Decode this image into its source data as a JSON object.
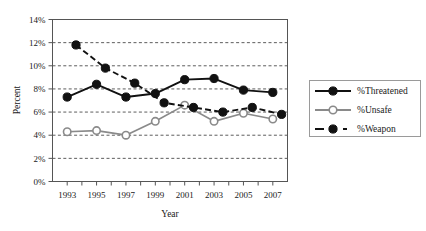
{
  "chart_data": {
    "type": "line",
    "title": "",
    "xlabel": "Year",
    "ylabel": "Percent",
    "x": [
      1993,
      1995,
      1997,
      1999,
      2001,
      2003,
      2005,
      2007
    ],
    "xtick_labels": [
      "1993",
      "1995",
      "1997",
      "1999",
      "2001",
      "2003",
      "2005",
      "2007"
    ],
    "ytick_labels": [
      "0%",
      "2%",
      "4%",
      "6%",
      "8%",
      "10%",
      "12%",
      "14%"
    ],
    "ytick_values": [
      0,
      2,
      4,
      6,
      8,
      10,
      12,
      14
    ],
    "ylim": [
      0,
      14
    ],
    "xlim": [
      1992,
      2008
    ],
    "grid": "horizontal-dashed",
    "legend_position": "right-outside",
    "series": [
      {
        "name": "%Threatened",
        "values": [
          7.3,
          8.4,
          7.3,
          7.6,
          8.8,
          8.9,
          7.9,
          7.7
        ],
        "color": "#111111",
        "style": "solid",
        "marker": "filled-circle"
      },
      {
        "name": "%Unsafe",
        "values": [
          4.3,
          4.4,
          4.0,
          5.2,
          6.6,
          5.2,
          5.9,
          5.4
        ],
        "color": "#8a8a8a",
        "style": "solid",
        "marker": "open-circle"
      },
      {
        "name": "%Weapon",
        "values": [
          11.8,
          9.8,
          8.5,
          6.8,
          6.4,
          6.0,
          6.4,
          5.8
        ],
        "color": "#111111",
        "style": "dashed",
        "marker": "filled-circle"
      }
    ]
  },
  "legend": {
    "items": [
      {
        "label": "%Threatened",
        "key": "line-solid-black-filled-circle"
      },
      {
        "label": "%Unsafe",
        "key": "line-solid-gray-open-circle"
      },
      {
        "label": "%Weapon",
        "key": "line-dashed-black-filled-circle"
      }
    ]
  },
  "axes": {
    "x_title": "Year",
    "y_title": "Percent"
  }
}
